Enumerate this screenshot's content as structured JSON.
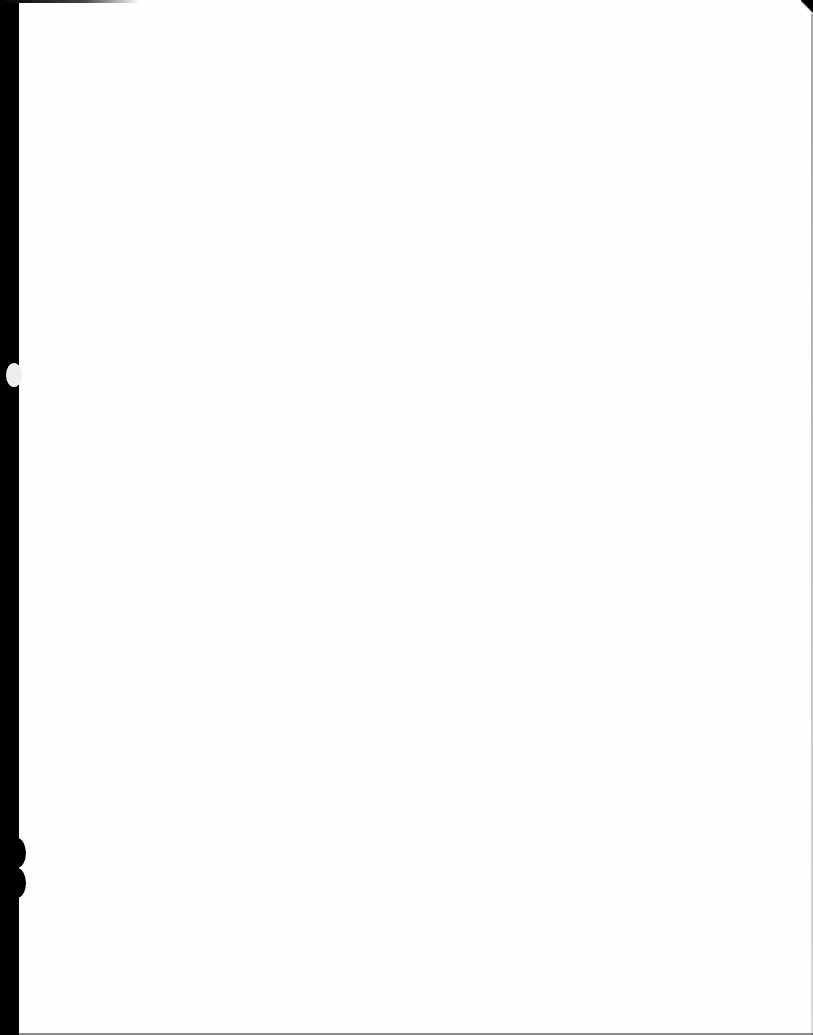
{
  "document": {
    "type": "scanned-page",
    "content": "",
    "colors": {
      "paper": "#ffffff",
      "scan_border": "#000000"
    }
  }
}
